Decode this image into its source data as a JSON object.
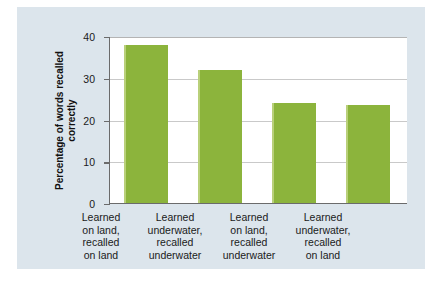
{
  "chart_data": {
    "type": "bar",
    "title": "",
    "xlabel": "",
    "ylabel_lines": [
      "Percentage of words",
      "recalled correctly"
    ],
    "ylabel": "Percentage of words recalled correctly",
    "categories": [
      "Learned on land, recalled on land",
      "Learned underwater, recalled underwater",
      "Learned on land, recalled underwater",
      "Learned underwater, recalled on land"
    ],
    "category_lines": [
      [
        "Learned",
        "on land,",
        "recalled",
        "on land"
      ],
      [
        "Learned",
        "underwater,",
        "recalled",
        "underwater"
      ],
      [
        "Learned",
        "on land,",
        "recalled",
        "underwater"
      ],
      [
        "Learned",
        "underwater,",
        "recalled",
        "on land"
      ]
    ],
    "values": [
      38,
      32,
      24,
      23.5
    ],
    "ylim": [
      0,
      40
    ],
    "yticks": [
      0,
      10,
      20,
      30,
      40
    ],
    "ytick_labels": [
      "0",
      "10",
      "20",
      "30",
      "40"
    ],
    "grid": true,
    "legend": null,
    "bar_color": "#8cb43c",
    "panel_color": "#dce5ec",
    "plot_background": "#ffffff",
    "axis_color": "#6b6b6b",
    "gridline_color": "#c9c9c9"
  }
}
